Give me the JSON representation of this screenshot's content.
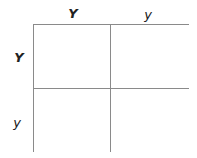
{
  "diagram": {
    "type": "punnett-square",
    "column_alleles": [
      {
        "label": "Y",
        "style": "bold-italic"
      },
      {
        "label": "y",
        "style": "italic"
      }
    ],
    "row_alleles": [
      {
        "label": "Y",
        "style": "bold-italic"
      },
      {
        "label": "y",
        "style": "italic"
      }
    ],
    "cells": [
      [
        "",
        ""
      ],
      [
        "",
        ""
      ]
    ],
    "colors": {
      "grid_line": "#8a8a8a",
      "text": "#222222",
      "background": "#ffffff"
    }
  }
}
